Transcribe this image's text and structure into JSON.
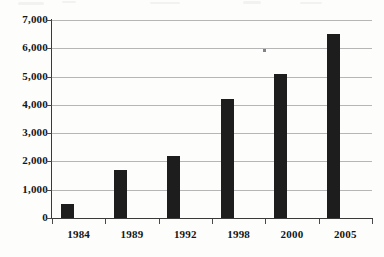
{
  "chart_data": {
    "type": "bar",
    "title": "",
    "subtitle": "",
    "xlabel": "",
    "ylabel": "",
    "categories": [
      "1984",
      "1989",
      "1992",
      "1998",
      "2000",
      "2005"
    ],
    "values": [
      500,
      1700,
      2200,
      4200,
      5100,
      6500
    ],
    "series": [
      {
        "name": "",
        "values": [
          500,
          1700,
          2200,
          4200,
          5100,
          6500
        ]
      }
    ],
    "ylim": [
      0,
      7000
    ],
    "y_tick_step": 1000,
    "y_tick_labels": [
      "0",
      "1,000",
      "2,000",
      "3,000",
      "4,000",
      "5,000",
      "6,000",
      "7,000"
    ],
    "y_tick_values": [
      0,
      1000,
      2000,
      3000,
      4000,
      5000,
      6000,
      7000
    ],
    "x_tick_labels": [
      "1984",
      "1989",
      "1992",
      "1998",
      "2000",
      "2005"
    ],
    "grid": true,
    "grid_axis": "y",
    "legend": false,
    "legend_position": "none",
    "annotations": [],
    "colors": {
      "bar": "#1d1d1d",
      "gridline": "#b6b6b6",
      "axis": "#3a3a3a",
      "text": "#151515",
      "background": "#fdfdfc"
    }
  }
}
